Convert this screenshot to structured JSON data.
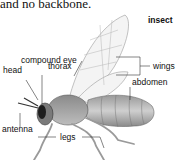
{
  "caption": "and no backbone.",
  "diagram": {
    "title": "insect",
    "labels": {
      "compound_eye": "compound eye",
      "wings": "wings",
      "head": "head",
      "thorax": "thorax",
      "abdomen": "abdomen",
      "antenna": "antenna",
      "legs": "legs"
    }
  }
}
